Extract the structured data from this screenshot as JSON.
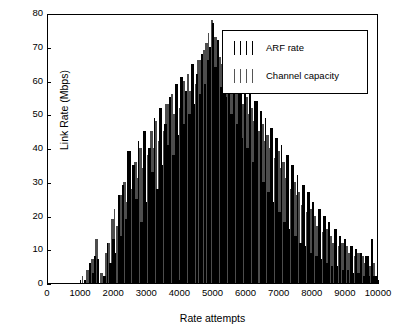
{
  "chart_data": {
    "type": "bar",
    "title": "",
    "xlabel": "Rate attempts",
    "ylabel": "Link Rate (Mbps)",
    "xlim": [
      0,
      10000
    ],
    "ylim": [
      0,
      80
    ],
    "xticks": [
      0,
      1000,
      2000,
      3000,
      4000,
      5000,
      6000,
      7000,
      8000,
      9000,
      10000
    ],
    "yticks": [
      0,
      10,
      20,
      30,
      40,
      50,
      60,
      70,
      80
    ],
    "grid": false,
    "legend_position": "top-right",
    "legend": [
      {
        "name": "ARF rate",
        "color": "#000000"
      },
      {
        "name": "Channel capacity",
        "color": "#555555"
      }
    ],
    "series": [
      {
        "name": "Channel capacity",
        "color": "#4d4d4d",
        "x": [
          1050,
          1180,
          1320,
          1390,
          1460,
          1600,
          1750,
          1840,
          1930,
          2010,
          2090,
          2160,
          2240,
          2310,
          2390,
          2460,
          2540,
          2620,
          2700,
          2780,
          2860,
          2940,
          3020,
          3100,
          3180,
          3260,
          3340,
          3420,
          3500,
          3580,
          3660,
          3740,
          3820,
          3900,
          3980,
          4060,
          4140,
          4220,
          4300,
          4380,
          4460,
          4540,
          4620,
          4700,
          4780,
          4860,
          4940,
          5020,
          5100,
          5180,
          5260,
          5340,
          5420,
          5500,
          5580,
          5660,
          5740,
          5820,
          5900,
          5980,
          6060,
          6140,
          6220,
          6300,
          6380,
          6460,
          6540,
          6620,
          6700,
          6780,
          6860,
          6940,
          7020,
          7100,
          7180,
          7260,
          7340,
          7420,
          7500,
          7580,
          7660,
          7740,
          7820,
          7900,
          7980,
          8060,
          8140,
          8220,
          8300,
          8380,
          8460,
          8540,
          8620,
          8700,
          8780,
          8860,
          8940,
          9020,
          9100,
          9180,
          9260,
          9340,
          9420,
          9500,
          9580,
          9660,
          9740,
          9820
        ],
        "values": [
          2,
          4,
          7,
          5,
          13,
          3,
          9,
          12,
          19,
          22,
          17,
          26,
          21,
          30,
          24,
          33,
          28,
          36,
          31,
          40,
          34,
          43,
          38,
          45,
          40,
          48,
          42,
          51,
          45,
          53,
          48,
          56,
          50,
          58,
          52,
          60,
          55,
          62,
          57,
          64,
          59,
          66,
          62,
          69,
          71,
          74,
          78,
          73,
          70,
          67,
          65,
          63,
          61,
          66,
          58,
          60,
          56,
          58,
          53,
          55,
          50,
          52,
          48,
          50,
          45,
          47,
          42,
          44,
          40,
          42,
          37,
          39,
          34,
          36,
          31,
          33,
          28,
          30,
          26,
          27,
          23,
          25,
          21,
          22,
          19,
          20,
          17,
          18,
          15,
          16,
          13,
          14,
          12,
          13,
          11,
          12,
          10,
          11,
          9,
          10,
          8,
          9,
          7,
          8,
          6,
          7,
          5,
          6
        ]
      },
      {
        "name": "ARF rate",
        "color": "#000000",
        "x": [
          1130,
          1260,
          1350,
          1420,
          1500,
          1680,
          1800,
          1880,
          1960,
          2050,
          2130,
          2200,
          2280,
          2350,
          2430,
          2500,
          2580,
          2660,
          2740,
          2820,
          2900,
          2980,
          3060,
          3140,
          3220,
          3300,
          3380,
          3460,
          3540,
          3620,
          3700,
          3780,
          3860,
          3940,
          4020,
          4100,
          4180,
          4260,
          4340,
          4420,
          4500,
          4580,
          4660,
          4740,
          4820,
          4900,
          4980,
          5060,
          5140,
          5220,
          5300,
          5380,
          5460,
          5540,
          5620,
          5700,
          5780,
          5860,
          5940,
          6020,
          6100,
          6180,
          6260,
          6340,
          6420,
          6500,
          6580,
          6660,
          6740,
          6820,
          6900,
          6980,
          7060,
          7140,
          7220,
          7300,
          7380,
          7460,
          7540,
          7620,
          7700,
          7780,
          7860,
          7940,
          8020,
          8100,
          8180,
          8260,
          8340,
          8420,
          8500,
          8580,
          8660,
          8740,
          8820,
          8900,
          8980,
          9060,
          9140,
          9220,
          9300,
          9380,
          9460,
          9540,
          9620,
          9700,
          9780,
          9860
        ],
        "values": [
          1,
          6,
          3,
          8,
          7,
          2,
          12,
          6,
          13,
          9,
          26,
          14,
          29,
          19,
          39,
          22,
          35,
          25,
          42,
          18,
          45,
          24,
          40,
          33,
          49,
          28,
          52,
          35,
          47,
          41,
          55,
          38,
          59,
          44,
          61,
          47,
          57,
          50,
          65,
          53,
          62,
          56,
          68,
          59,
          66,
          70,
          77,
          64,
          72,
          58,
          69,
          55,
          67,
          50,
          64,
          47,
          62,
          43,
          59,
          40,
          56,
          36,
          54,
          33,
          51,
          30,
          49,
          27,
          46,
          24,
          43,
          21,
          41,
          18,
          38,
          16,
          35,
          14,
          32,
          12,
          29,
          11,
          27,
          9,
          24,
          8,
          22,
          7,
          20,
          6,
          18,
          5,
          16,
          5,
          14,
          4,
          13,
          4,
          11,
          3,
          10,
          3,
          9,
          2,
          8,
          2,
          13,
          2
        ]
      }
    ]
  }
}
